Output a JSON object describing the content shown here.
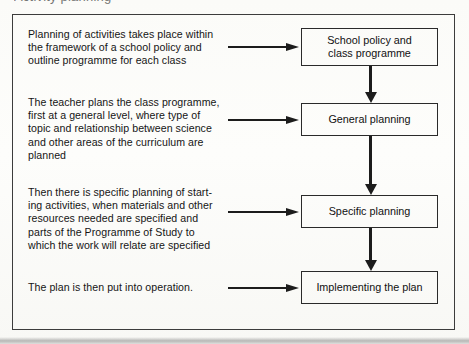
{
  "figure": {
    "heading": "Activity planning",
    "frame_border_color": "#3c3c3c",
    "ink_color": "#1c1c1c",
    "paper_color": "#fcfcfa"
  },
  "steps": [
    {
      "description": "Planning of activities takes place within\nthe framework of a school policy and\noutline programme for each class",
      "stage": "School policy and\nclass programme"
    },
    {
      "description": "The teacher plans the class programme,\nfirst at a general level, where type of\ntopic and relationship between science\nand other areas of the curriculum are\nplanned",
      "stage": "General planning"
    },
    {
      "description": "Then there is specific planning of start-\ning activities, when materials and other\nresources needed are specified and\nparts of the Programme of Study to\nwhich the work will relate are specified",
      "stage": "Specific planning"
    },
    {
      "description": "The plan is then put into operation.",
      "stage": "Implementing the plan"
    }
  ],
  "connectors": {
    "horizontal_count": 4,
    "vertical_count": 3,
    "horizontal_direction": "right",
    "vertical_direction": "down"
  }
}
